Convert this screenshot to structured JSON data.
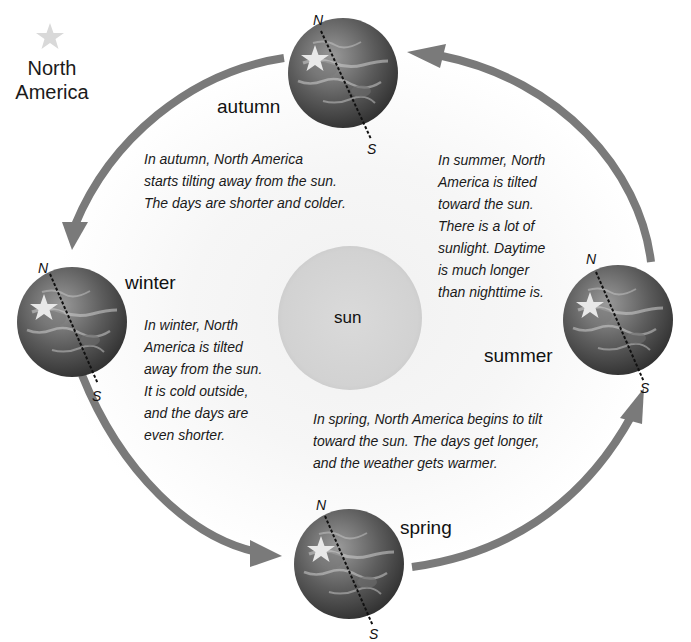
{
  "legend": {
    "icon": "star-icon",
    "line1": "North",
    "line2": "America"
  },
  "sun": {
    "label": "sun"
  },
  "seasons": {
    "autumn": {
      "label": "autumn",
      "north": "N",
      "south": "S",
      "description": [
        "In autumn, North America",
        "starts tilting away from the sun.",
        "The days are shorter and colder."
      ]
    },
    "summer": {
      "label": "summer",
      "north": "N",
      "south": "S",
      "description": [
        "In summer, North",
        "America is tilted",
        "toward the sun.",
        "There is a lot of",
        "sunlight. Daytime",
        "is much longer",
        "than nighttime is."
      ]
    },
    "winter": {
      "label": "winter",
      "north": "N",
      "south": "S",
      "description": [
        "In winter, North",
        "America is tilted",
        "away from the sun.",
        "It is cold outside,",
        "and the days are",
        "even shorter."
      ]
    },
    "spring": {
      "label": "spring",
      "north": "N",
      "south": "S",
      "description": [
        "In spring, North America begins to tilt",
        "toward the sun. The days get longer,",
        "and the weather gets warmer."
      ]
    }
  },
  "colors": {
    "arrow": "#7a7a7a",
    "sun": "#d6d6d6",
    "globe_dark": "#3e3e3e",
    "globe_light": "#8a8a8a",
    "star": "#d9d9d9"
  }
}
